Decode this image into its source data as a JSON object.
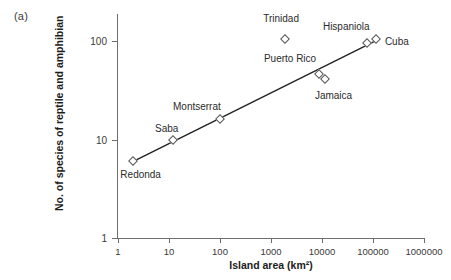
{
  "panel": {
    "label": "(a)"
  },
  "chart_data": {
    "type": "scatter",
    "title": "",
    "xlabel": "Island area (km²)",
    "ylabel": "No. of species of reptile and amphibian",
    "xscale": "log",
    "yscale": "log",
    "xlim": [
      1,
      1000000
    ],
    "ylim": [
      1,
      200
    ],
    "grid": false,
    "legend": false,
    "xticks": [
      1,
      10,
      100,
      1000,
      10000,
      100000,
      1000000
    ],
    "xticklabels": [
      "1",
      "10",
      "100",
      "1000",
      "10000",
      "100000",
      "1000000"
    ],
    "yticks": [
      1,
      10,
      100
    ],
    "yticklabels": [
      "1",
      "10",
      "100"
    ],
    "points": [
      {
        "label": "Redonda",
        "x": 2,
        "y": 6,
        "label_dx": -13,
        "label_dy": 14
      },
      {
        "label": "Saba",
        "x": 12,
        "y": 10,
        "label_dx": -18,
        "label_dy": -11
      },
      {
        "label": "Montserrat",
        "x": 100,
        "y": 16,
        "label_dx": -47,
        "label_dy": -12
      },
      {
        "label": "Trinidad",
        "x": 1900,
        "y": 105,
        "label_dx": -22,
        "label_dy": -20
      },
      {
        "label": "Puerto Rico",
        "x": 8700,
        "y": 46,
        "label_dx": -55,
        "label_dy": -15
      },
      {
        "label": "Jamaica",
        "x": 11400,
        "y": 41,
        "label_dx": -10,
        "label_dy": 17
      },
      {
        "label": "Hispaniola",
        "x": 76000,
        "y": 95,
        "label_dx": -44,
        "label_dy": -16
      },
      {
        "label": "Cuba",
        "x": 114000,
        "y": 105,
        "label_dx": 9,
        "label_dy": 3
      }
    ],
    "trendline": {
      "description": "fitted species-area regression line",
      "x_start": 2,
      "y_start": 6,
      "x_end": 120000,
      "y_end": 102
    },
    "colors": {
      "line": "#222222",
      "marker_edge": "#555555",
      "marker_fill": "#ffffff",
      "axis": "#6e6e6e",
      "text": "#1c1c1c"
    }
  }
}
